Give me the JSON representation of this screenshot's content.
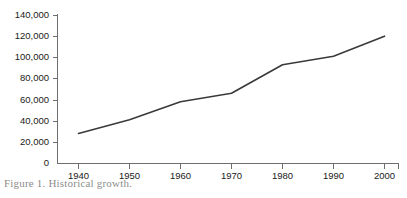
{
  "chart_data": {
    "type": "line",
    "title": "",
    "xlabel": "",
    "ylabel": "",
    "categories": [
      1940,
      1950,
      1960,
      1970,
      1980,
      1990,
      2000
    ],
    "values": [
      28000,
      41000,
      58000,
      66000,
      93000,
      101000,
      120000
    ],
    "series": [
      {
        "name": "",
        "values": [
          28000,
          41000,
          58000,
          66000,
          93000,
          101000,
          120000
        ]
      }
    ],
    "xlim": [
      1935,
      2005
    ],
    "ylim": [
      0,
      140000
    ],
    "ytick_values": [
      0,
      20000,
      40000,
      60000,
      80000,
      100000,
      120000,
      140000
    ],
    "ytick_labels": [
      "0",
      "20,000",
      "40,000",
      "60,000",
      "80,000",
      "100,000",
      "120,000",
      "140,000"
    ],
    "xtick_values": [
      1940,
      1950,
      1960,
      1970,
      1980,
      1990,
      2000
    ],
    "xtick_labels": [
      "1940",
      "1950",
      "1960",
      "1970",
      "1980",
      "1990",
      "2000"
    ],
    "grid": false,
    "legend": false,
    "line_color": "#3a3a3a",
    "axis_color": "#6e6e6e"
  },
  "caption": {
    "text": "Figure 1. Historical growth."
  }
}
